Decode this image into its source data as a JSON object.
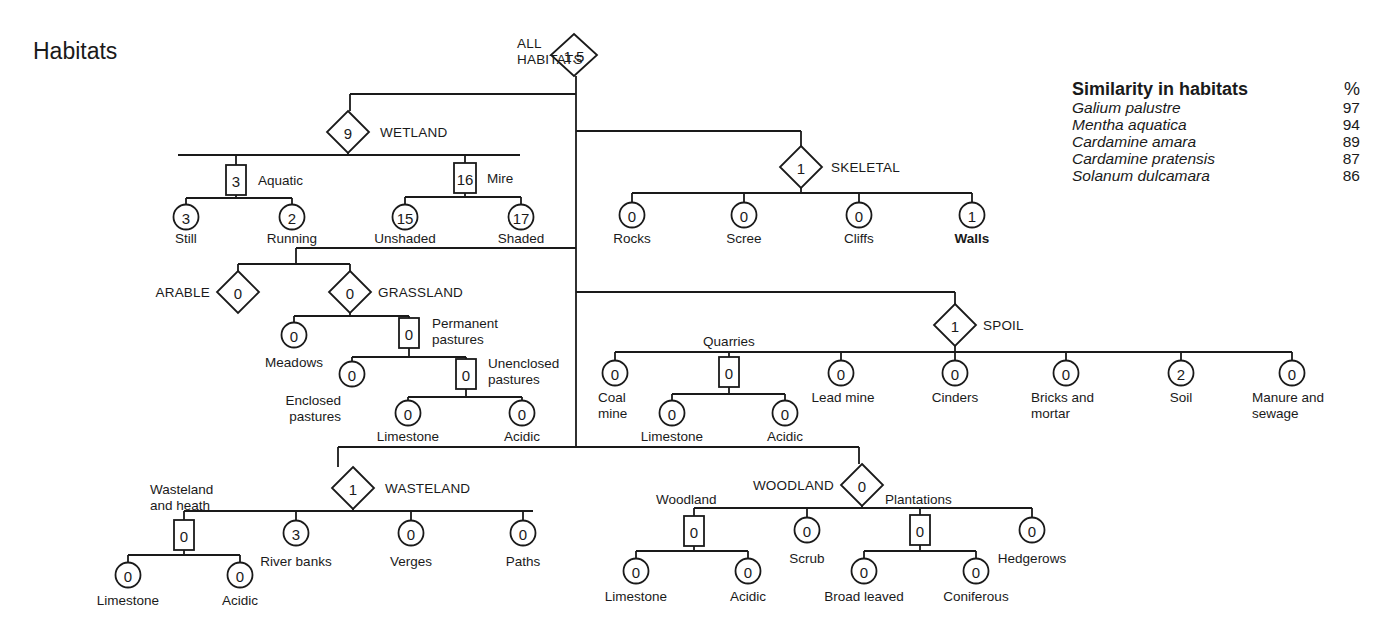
{
  "title": "Habitats",
  "legend": {
    "title": "Similarity in habitats",
    "unit": "%",
    "rows": [
      {
        "species": "Galium palustre",
        "value": 97
      },
      {
        "species": "Mentha aquatica",
        "value": 94
      },
      {
        "species": "Cardamine amara",
        "value": 89
      },
      {
        "species": "Cardamine pratensis",
        "value": 87
      },
      {
        "species": "Solanum dulcamara",
        "value": 86
      }
    ]
  },
  "shape_legend": {
    "diamond": "major habitat group",
    "square": "habitat subgroup",
    "circle": "individual habitat"
  },
  "nodes": [
    {
      "id": "all",
      "shape": "diamond",
      "value": "1.5",
      "x": 574,
      "y": 55,
      "label": [
        "ALL",
        "HABITATS"
      ],
      "lx": 517,
      "ly": 48,
      "anchor": "start",
      "caps": true
    },
    {
      "id": "wetland",
      "shape": "diamond",
      "value": "9",
      "x": 348,
      "y": 132,
      "label": [
        "WETLAND"
      ],
      "lx": 380,
      "ly": 137,
      "anchor": "start",
      "caps": true
    },
    {
      "id": "aquatic",
      "shape": "square",
      "value": "3",
      "x": 236,
      "y": 180,
      "label": [
        "Aquatic"
      ],
      "lx": 258,
      "ly": 185,
      "anchor": "start"
    },
    {
      "id": "still",
      "shape": "circle",
      "value": "3",
      "x": 186,
      "y": 217,
      "label": [
        "Still"
      ],
      "lx": 186,
      "ly": 243,
      "anchor": "middle"
    },
    {
      "id": "running",
      "shape": "circle",
      "value": "2",
      "x": 292,
      "y": 217,
      "label": [
        "Running"
      ],
      "lx": 292,
      "ly": 243,
      "anchor": "middle"
    },
    {
      "id": "mire",
      "shape": "square",
      "value": "16",
      "x": 465,
      "y": 178,
      "label": [
        "Mire"
      ],
      "lx": 487,
      "ly": 183,
      "anchor": "start"
    },
    {
      "id": "unshaded",
      "shape": "circle",
      "value": "15",
      "x": 405,
      "y": 217,
      "label": [
        "Unshaded"
      ],
      "lx": 405,
      "ly": 243,
      "anchor": "middle"
    },
    {
      "id": "shaded",
      "shape": "circle",
      "value": "17",
      "x": 521,
      "y": 217,
      "label": [
        "Shaded"
      ],
      "lx": 521,
      "ly": 243,
      "anchor": "middle"
    },
    {
      "id": "skeletal",
      "shape": "diamond",
      "value": "1",
      "x": 801,
      "y": 167,
      "label": [
        "SKELETAL"
      ],
      "lx": 831,
      "ly": 172,
      "anchor": "start",
      "caps": true
    },
    {
      "id": "rocks",
      "shape": "circle",
      "value": "0",
      "x": 632,
      "y": 215,
      "label": [
        "Rocks"
      ],
      "lx": 632,
      "ly": 243,
      "anchor": "middle"
    },
    {
      "id": "scree",
      "shape": "circle",
      "value": "0",
      "x": 744,
      "y": 215,
      "label": [
        "Scree"
      ],
      "lx": 744,
      "ly": 243,
      "anchor": "middle"
    },
    {
      "id": "cliffs",
      "shape": "circle",
      "value": "0",
      "x": 859,
      "y": 215,
      "label": [
        "Cliffs"
      ],
      "lx": 859,
      "ly": 243,
      "anchor": "middle"
    },
    {
      "id": "walls",
      "shape": "circle",
      "value": "1",
      "x": 972,
      "y": 215,
      "label": [
        "Walls"
      ],
      "lx": 972,
      "ly": 243,
      "anchor": "middle",
      "bold": true
    },
    {
      "id": "arable",
      "shape": "diamond",
      "value": "0",
      "x": 238,
      "y": 292,
      "label": [
        "ARABLE"
      ],
      "lx": 210,
      "ly": 297,
      "anchor": "end",
      "caps": true
    },
    {
      "id": "grassland",
      "shape": "diamond",
      "value": "0",
      "x": 350,
      "y": 292,
      "label": [
        "GRASSLAND"
      ],
      "lx": 378,
      "ly": 297,
      "anchor": "start",
      "caps": true
    },
    {
      "id": "meadows",
      "shape": "circle",
      "value": "0",
      "x": 294,
      "y": 335,
      "label": [
        "Meadows"
      ],
      "lx": 294,
      "ly": 367,
      "anchor": "middle"
    },
    {
      "id": "permanent",
      "shape": "square",
      "value": "0",
      "x": 409,
      "y": 333,
      "label": [
        "Permanent",
        "pastures"
      ],
      "lx": 432,
      "ly": 328,
      "anchor": "start"
    },
    {
      "id": "enclosed",
      "shape": "circle",
      "value": "0",
      "x": 352,
      "y": 374,
      "label": [
        "Enclosed",
        "pastures"
      ],
      "lx": 341,
      "ly": 405,
      "anchor": "end"
    },
    {
      "id": "unenclosed",
      "shape": "square",
      "value": "0",
      "x": 466,
      "y": 374,
      "label": [
        "Unenclosed",
        "pastures"
      ],
      "lx": 488,
      "ly": 368,
      "anchor": "start"
    },
    {
      "id": "g_limestone",
      "shape": "circle",
      "value": "0",
      "x": 408,
      "y": 413,
      "label": [
        "Limestone"
      ],
      "lx": 408,
      "ly": 441,
      "anchor": "middle"
    },
    {
      "id": "g_acidic",
      "shape": "circle",
      "value": "0",
      "x": 522,
      "y": 413,
      "label": [
        "Acidic"
      ],
      "lx": 522,
      "ly": 441,
      "anchor": "middle"
    },
    {
      "id": "spoil",
      "shape": "diamond",
      "value": "1",
      "x": 955,
      "y": 325,
      "label": [
        "SPOIL"
      ],
      "lx": 983,
      "ly": 330,
      "anchor": "start",
      "caps": true
    },
    {
      "id": "coalmine",
      "shape": "circle",
      "value": "0",
      "x": 615,
      "y": 373,
      "label": [
        "Coal",
        "mine"
      ],
      "lx": 598,
      "ly": 402,
      "anchor": "start"
    },
    {
      "id": "quarries",
      "shape": "square",
      "value": "0",
      "x": 729,
      "y": 372,
      "label": [
        "Quarries"
      ],
      "lx": 729,
      "ly": 346,
      "anchor": "middle"
    },
    {
      "id": "q_limestone",
      "shape": "circle",
      "value": "0",
      "x": 672,
      "y": 413,
      "label": [
        "Limestone"
      ],
      "lx": 672,
      "ly": 441,
      "anchor": "middle"
    },
    {
      "id": "q_acidic",
      "shape": "circle",
      "value": "0",
      "x": 785,
      "y": 413,
      "label": [
        "Acidic"
      ],
      "lx": 785,
      "ly": 441,
      "anchor": "middle"
    },
    {
      "id": "leadmine",
      "shape": "circle",
      "value": "0",
      "x": 841,
      "y": 373,
      "label": [
        "Lead mine"
      ],
      "lx": 843,
      "ly": 402,
      "anchor": "middle"
    },
    {
      "id": "cinders",
      "shape": "circle",
      "value": "0",
      "x": 955,
      "y": 373,
      "label": [
        "Cinders"
      ],
      "lx": 955,
      "ly": 402,
      "anchor": "middle"
    },
    {
      "id": "bricks",
      "shape": "circle",
      "value": "0",
      "x": 1066,
      "y": 373,
      "label": [
        "Bricks and",
        "mortar"
      ],
      "lx": 1031,
      "ly": 402,
      "anchor": "start"
    },
    {
      "id": "soil",
      "shape": "circle",
      "value": "2",
      "x": 1181,
      "y": 373,
      "label": [
        "Soil"
      ],
      "lx": 1181,
      "ly": 402,
      "anchor": "middle"
    },
    {
      "id": "manure",
      "shape": "circle",
      "value": "0",
      "x": 1292,
      "y": 373,
      "label": [
        "Manure and",
        "sewage"
      ],
      "lx": 1252,
      "ly": 402,
      "anchor": "start"
    },
    {
      "id": "wasteland",
      "shape": "diamond",
      "value": "1",
      "x": 353,
      "y": 488,
      "label": [
        "WASTELAND"
      ],
      "lx": 385,
      "ly": 493,
      "anchor": "start",
      "caps": true
    },
    {
      "id": "waste_heath",
      "shape": "square",
      "value": "0",
      "x": 184,
      "y": 535,
      "label": [
        "Wasteland",
        "and heath"
      ],
      "lx": 150,
      "ly": 494,
      "anchor": "start",
      "labelAbove": true
    },
    {
      "id": "w_limestone",
      "shape": "circle",
      "value": "0",
      "x": 128,
      "y": 575,
      "label": [
        "Limestone"
      ],
      "lx": 128,
      "ly": 605,
      "anchor": "middle"
    },
    {
      "id": "w_acidic",
      "shape": "circle",
      "value": "0",
      "x": 240,
      "y": 575,
      "label": [
        "Acidic"
      ],
      "lx": 240,
      "ly": 605,
      "anchor": "middle"
    },
    {
      "id": "riverbanks",
      "shape": "circle",
      "value": "3",
      "x": 296,
      "y": 533,
      "label": [
        "River banks"
      ],
      "lx": 296,
      "ly": 566,
      "anchor": "middle"
    },
    {
      "id": "verges",
      "shape": "circle",
      "value": "0",
      "x": 411,
      "y": 533,
      "label": [
        "Verges"
      ],
      "lx": 411,
      "ly": 566,
      "anchor": "middle"
    },
    {
      "id": "paths",
      "shape": "circle",
      "value": "0",
      "x": 523,
      "y": 533,
      "label": [
        "Paths"
      ],
      "lx": 523,
      "ly": 566,
      "anchor": "middle"
    },
    {
      "id": "woodland",
      "shape": "diamond",
      "value": "0",
      "x": 862,
      "y": 485,
      "label": [
        "WOODLAND"
      ],
      "lx": 834,
      "ly": 490,
      "anchor": "end",
      "caps": true
    },
    {
      "id": "woodland_sub",
      "shape": "square",
      "value": "0",
      "x": 694,
      "y": 531,
      "label": [
        "Woodland"
      ],
      "lx": 656,
      "ly": 504,
      "anchor": "start"
    },
    {
      "id": "wd_limestone",
      "shape": "circle",
      "value": "0",
      "x": 636,
      "y": 571,
      "label": [
        "Limestone"
      ],
      "lx": 636,
      "ly": 601,
      "anchor": "middle"
    },
    {
      "id": "wd_acidic",
      "shape": "circle",
      "value": "0",
      "x": 748,
      "y": 571,
      "label": [
        "Acidic"
      ],
      "lx": 748,
      "ly": 601,
      "anchor": "middle"
    },
    {
      "id": "scrub",
      "shape": "circle",
      "value": "0",
      "x": 807,
      "y": 530,
      "label": [
        "Scrub"
      ],
      "lx": 807,
      "ly": 563,
      "anchor": "middle"
    },
    {
      "id": "plantations",
      "shape": "square",
      "value": "0",
      "x": 920,
      "y": 530,
      "label": [
        "Plantations"
      ],
      "lx": 885,
      "ly": 504,
      "anchor": "start"
    },
    {
      "id": "broadleaved",
      "shape": "circle",
      "value": "0",
      "x": 864,
      "y": 571,
      "label": [
        "Broad leaved"
      ],
      "lx": 864,
      "ly": 601,
      "anchor": "middle"
    },
    {
      "id": "coniferous",
      "shape": "circle",
      "value": "0",
      "x": 976,
      "y": 571,
      "label": [
        "Coniferous"
      ],
      "lx": 976,
      "ly": 601,
      "anchor": "middle"
    },
    {
      "id": "hedgerows",
      "shape": "circle",
      "value": "0",
      "x": 1032,
      "y": 530,
      "label": [
        "Hedgerows"
      ],
      "lx": 1032,
      "ly": 563,
      "anchor": "middle"
    }
  ],
  "edges": [
    [
      576,
      76,
      576,
      447
    ],
    [
      576,
      94,
      350,
      94
    ],
    [
      350,
      94,
      350,
      111
    ],
    [
      576,
      131,
      801,
      131
    ],
    [
      801,
      131,
      801,
      146
    ],
    [
      576,
      248,
      296,
      248
    ],
    [
      296,
      248,
      296,
      260
    ],
    [
      576,
      292,
      955,
      292
    ],
    [
      955,
      292,
      955,
      304
    ],
    [
      338,
      447,
      859,
      447
    ],
    [
      338,
      447,
      338,
      467
    ],
    [
      859,
      447,
      859,
      464
    ],
    [
      348,
      153,
      348,
      155
    ],
    [
      178,
      155,
      520,
      155
    ],
    [
      236,
      155,
      236,
      165
    ],
    [
      465,
      155,
      465,
      163
    ],
    [
      236,
      195,
      236,
      198
    ],
    [
      186,
      198,
      292,
      198
    ],
    [
      186,
      198,
      186,
      204
    ],
    [
      292,
      198,
      292,
      204
    ],
    [
      465,
      193,
      465,
      197
    ],
    [
      405,
      197,
      521,
      197
    ],
    [
      405,
      197,
      405,
      204
    ],
    [
      521,
      197,
      521,
      204
    ],
    [
      801,
      188,
      801,
      193
    ],
    [
      632,
      193,
      972,
      193
    ],
    [
      632,
      193,
      632,
      202
    ],
    [
      744,
      193,
      744,
      202
    ],
    [
      859,
      193,
      859,
      202
    ],
    [
      972,
      193,
      972,
      202
    ],
    [
      238,
      264,
      350,
      264
    ],
    [
      238,
      264,
      238,
      271
    ],
    [
      350,
      264,
      350,
      271
    ],
    [
      296,
      260,
      296,
      264
    ],
    [
      350,
      313,
      350,
      316
    ],
    [
      294,
      316,
      409,
      316
    ],
    [
      294,
      316,
      294,
      322
    ],
    [
      409,
      316,
      409,
      318
    ],
    [
      409,
      348,
      409,
      357
    ],
    [
      352,
      357,
      466,
      357
    ],
    [
      352,
      357,
      352,
      361
    ],
    [
      466,
      357,
      466,
      359
    ],
    [
      466,
      389,
      466,
      397
    ],
    [
      408,
      397,
      522,
      397
    ],
    [
      408,
      397,
      408,
      400
    ],
    [
      522,
      397,
      522,
      400
    ],
    [
      955,
      346,
      955,
      352
    ],
    [
      615,
      352,
      1292,
      352
    ],
    [
      615,
      352,
      615,
      360
    ],
    [
      729,
      352,
      729,
      357
    ],
    [
      841,
      352,
      841,
      360
    ],
    [
      955,
      352,
      955,
      360
    ],
    [
      1066,
      352,
      1066,
      360
    ],
    [
      1181,
      352,
      1181,
      360
    ],
    [
      1292,
      352,
      1292,
      360
    ],
    [
      729,
      387,
      729,
      394
    ],
    [
      672,
      394,
      785,
      394
    ],
    [
      672,
      394,
      672,
      400
    ],
    [
      785,
      394,
      785,
      400
    ],
    [
      353,
      509,
      353,
      511
    ],
    [
      184,
      511,
      533,
      511
    ],
    [
      184,
      511,
      184,
      520
    ],
    [
      296,
      511,
      296,
      520
    ],
    [
      411,
      511,
      411,
      520
    ],
    [
      523,
      511,
      523,
      520
    ],
    [
      184,
      550,
      184,
      555
    ],
    [
      128,
      555,
      240,
      555
    ],
    [
      128,
      555,
      128,
      562
    ],
    [
      240,
      555,
      240,
      562
    ],
    [
      862,
      506,
      862,
      508
    ],
    [
      694,
      508,
      1032,
      508
    ],
    [
      694,
      508,
      694,
      516
    ],
    [
      807,
      508,
      807,
      517
    ],
    [
      920,
      508,
      920,
      515
    ],
    [
      1032,
      508,
      1032,
      517
    ],
    [
      694,
      546,
      694,
      551
    ],
    [
      636,
      551,
      748,
      551
    ],
    [
      636,
      551,
      636,
      558
    ],
    [
      748,
      551,
      748,
      558
    ],
    [
      920,
      545,
      920,
      551
    ],
    [
      864,
      551,
      976,
      551
    ],
    [
      864,
      551,
      864,
      558
    ],
    [
      976,
      551,
      976,
      558
    ]
  ]
}
